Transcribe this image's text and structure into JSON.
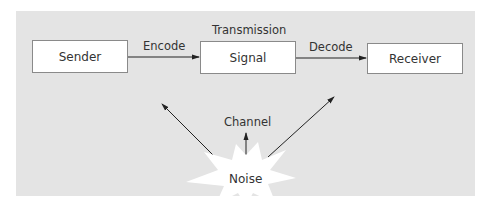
{
  "diagram": {
    "type": "communication-model",
    "nodes": [
      {
        "id": "sender",
        "label": "Sender"
      },
      {
        "id": "signal",
        "label": "Signal"
      },
      {
        "id": "receiver",
        "label": "Receiver"
      },
      {
        "id": "noise",
        "label": "Noise",
        "shape": "starburst"
      }
    ],
    "edges": [
      {
        "from": "sender",
        "to": "signal",
        "label": "Encode"
      },
      {
        "from": "signal",
        "to": "receiver",
        "label": "Decode"
      },
      {
        "from": "noise",
        "to": "channel",
        "label": ""
      },
      {
        "from": "noise",
        "to": "sender-signal-link",
        "label": ""
      },
      {
        "from": "noise",
        "to": "signal-receiver-link",
        "label": ""
      }
    ],
    "labels": {
      "transmission": "Transmission",
      "channel": "Channel",
      "encode": "Encode",
      "decode": "Decode"
    },
    "colors": {
      "panel": "#e4e4e4",
      "box_fill": "#ffffff",
      "box_border": "#8a8a8a",
      "line": "#222222",
      "noise_fill": "#ffffff"
    }
  }
}
